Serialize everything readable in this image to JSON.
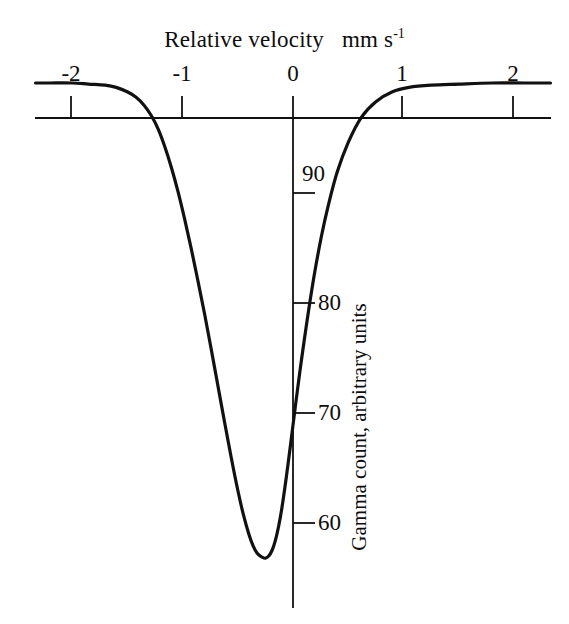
{
  "figure": {
    "background_color": "#ffffff",
    "line_color": "#111111"
  },
  "chart_data": {
    "type": "line",
    "title": "Relative velocity   mm s",
    "title_superscript": "-1",
    "xlabel": "Relative velocity   mm s-1",
    "ylabel": "Gamma count, arbitrary units",
    "xlim": [
      -2.33,
      2.33
    ],
    "ylim": [
      55.0,
      100.6
    ],
    "grid": false,
    "legend": null,
    "x_ticks": [
      -2,
      -1,
      0,
      1,
      2
    ],
    "x_tick_labels": [
      "-2",
      "-1",
      "0",
      "1",
      "2"
    ],
    "y_ticks": [
      60,
      70,
      80,
      90
    ],
    "y_tick_labels": [
      "60",
      "70",
      "80",
      "90"
    ],
    "baseline_value": 100,
    "minimum": {
      "x": -0.25,
      "y": 56.8
    },
    "annotations": [],
    "x": [
      -2.33,
      -2.2,
      -2.0,
      -1.85,
      -1.7,
      -1.6,
      -1.5,
      -1.42,
      -1.35,
      -1.28,
      -1.22,
      -1.16,
      -1.1,
      -1.04,
      -0.98,
      -0.92,
      -0.86,
      -0.8,
      -0.74,
      -0.68,
      -0.62,
      -0.56,
      -0.5,
      -0.45,
      -0.4,
      -0.36,
      -0.32,
      -0.28,
      -0.25,
      -0.22,
      -0.19,
      -0.16,
      -0.13,
      -0.1,
      -0.06,
      -0.02,
      0.02,
      0.06,
      0.1,
      0.15,
      0.2,
      0.26,
      0.32,
      0.4,
      0.5,
      0.62,
      0.75,
      0.9,
      1.05,
      1.25,
      1.5,
      1.8,
      2.1,
      2.33
    ],
    "y": [
      100.0,
      100.0,
      100.0,
      99.9,
      99.8,
      99.6,
      99.2,
      98.7,
      98.0,
      97.0,
      95.8,
      94.2,
      92.3,
      90.1,
      87.6,
      84.9,
      82.0,
      79.0,
      75.8,
      72.5,
      69.2,
      66.0,
      63.0,
      60.8,
      59.0,
      57.9,
      57.2,
      56.9,
      56.8,
      57.0,
      57.5,
      58.4,
      59.7,
      61.4,
      64.2,
      67.3,
      70.5,
      73.6,
      76.5,
      79.9,
      83.0,
      86.2,
      88.9,
      91.9,
      94.6,
      96.9,
      98.3,
      99.2,
      99.6,
      99.8,
      99.9,
      100.0,
      100.0,
      100.0
    ],
    "series": [
      {
        "name": "Mossbauer absorption spectrum",
        "values": [
          100.0,
          100.0,
          100.0,
          99.9,
          99.8,
          99.6,
          99.2,
          98.7,
          98.0,
          97.0,
          95.8,
          94.2,
          92.3,
          90.1,
          87.6,
          84.9,
          82.0,
          79.0,
          75.8,
          72.5,
          69.2,
          66.0,
          63.0,
          60.8,
          59.0,
          57.9,
          57.2,
          56.9,
          56.8,
          57.0,
          57.5,
          58.4,
          59.7,
          61.4,
          64.2,
          67.3,
          70.5,
          73.6,
          76.5,
          79.9,
          83.0,
          86.2,
          88.9,
          91.9,
          94.6,
          96.9,
          98.3,
          99.2,
          99.6,
          99.8,
          99.9,
          100.0,
          100.0,
          100.0
        ]
      }
    ]
  }
}
